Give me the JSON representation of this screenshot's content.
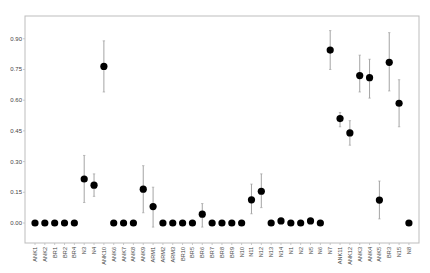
{
  "chart_data": {
    "type": "scatter",
    "subtype": "point-with-error-bars",
    "title": "",
    "xlabel": "",
    "ylabel": "",
    "ylim": [
      -0.08,
      0.99
    ],
    "yticks": [
      0.0,
      0.15,
      0.3,
      0.45,
      0.6,
      0.75,
      0.9
    ],
    "ytick_labels": [
      "0.00",
      "0.15",
      "0.30",
      "0.45",
      "0.60",
      "0.75",
      "0.90"
    ],
    "grid": false,
    "legend": null,
    "categories": [
      "ANK1",
      "ANK2",
      "BR1",
      "BR2",
      "BR4",
      "N3",
      "N4",
      "ANK10",
      "ANK6",
      "ANK7",
      "ANK8",
      "ANK9",
      "ARM1",
      "ARM2",
      "ARM3",
      "BR10",
      "BR5",
      "BR6",
      "BR7",
      "BR8",
      "BR9",
      "N10",
      "N11",
      "N12",
      "N13",
      "N14",
      "N1",
      "N2",
      "N5",
      "N6",
      "N7",
      "ANK11",
      "ANK12",
      "ANK3",
      "ANK4",
      "ANK5",
      "BR3",
      "N15",
      "N8"
    ],
    "values": [
      0,
      0,
      0,
      0,
      0,
      0.215,
      0.185,
      0.765,
      0,
      0,
      0,
      0.165,
      0.08,
      0,
      0,
      0,
      0,
      0.043,
      0,
      0,
      0,
      0,
      0.113,
      0.155,
      0,
      0.01,
      0,
      0,
      0.01,
      0,
      0.845,
      0.51,
      0.44,
      0.72,
      0.71,
      0.112,
      0.785,
      0.585,
      0
    ],
    "error_low": [
      null,
      null,
      null,
      null,
      null,
      0.1,
      0.13,
      0.64,
      null,
      null,
      null,
      0.05,
      -0.02,
      null,
      null,
      null,
      null,
      -0.02,
      null,
      null,
      null,
      null,
      0.045,
      0.075,
      null,
      null,
      null,
      null,
      null,
      null,
      0.75,
      0.47,
      0.38,
      0.64,
      0.61,
      0.02,
      0.645,
      0.47,
      null
    ],
    "error_high": [
      null,
      null,
      null,
      null,
      null,
      0.33,
      0.24,
      0.89,
      null,
      null,
      null,
      0.28,
      0.175,
      null,
      null,
      null,
      null,
      0.095,
      null,
      null,
      null,
      null,
      0.19,
      0.24,
      null,
      null,
      null,
      null,
      null,
      null,
      0.94,
      0.54,
      0.5,
      0.82,
      0.8,
      0.205,
      0.93,
      0.7,
      null
    ],
    "colors": {
      "marker": "#000000",
      "error_bar": "#9a9a9a",
      "frame": "#bdbdbd",
      "tick_text": "#444444"
    }
  }
}
